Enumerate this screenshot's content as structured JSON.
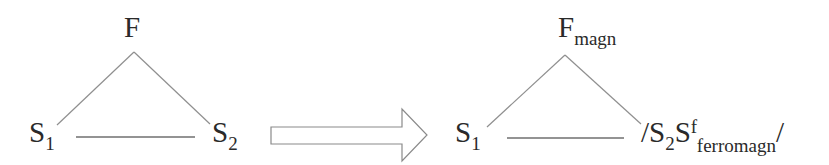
{
  "left_diagram": {
    "apex": {
      "base": "F",
      "subscript": ""
    },
    "left_node": {
      "base": "S",
      "subscript": "1"
    },
    "right_node": {
      "base": "S",
      "subscript": "2"
    }
  },
  "arrow": {
    "direction": "right",
    "style": "hollow-block-arrow",
    "stroke": "#8a8a8a"
  },
  "right_diagram": {
    "apex": {
      "base": "F",
      "subscript": "magn"
    },
    "left_node": {
      "base": "S",
      "subscript": "1"
    },
    "right_node": {
      "prefix": "/",
      "base": "S",
      "subscript": "2",
      "base2": "S",
      "superscript": "f",
      "subscript2": "ferromagn",
      "suffix": "/"
    }
  },
  "colors": {
    "line": "#8f8f8f",
    "text": "#2a2a2a",
    "background": "#ffffff"
  }
}
